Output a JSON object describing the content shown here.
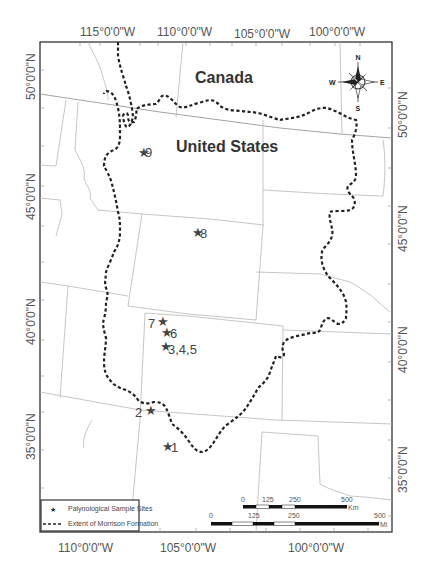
{
  "map": {
    "countries": [
      {
        "name": "Canada"
      },
      {
        "name": "United States"
      }
    ],
    "longitude_labels_top": [
      "115°0'0\"W",
      "110°0'0\"W",
      "105°0'0\"W",
      "100°0'0\"W"
    ],
    "longitude_labels_bottom": [
      "110°0'0\"W",
      "105°0'0\"W",
      "100°0'0\"W"
    ],
    "latitude_labels_left": [
      "50°0'0\"N",
      "45°0'0\"N",
      "40°0'0\"N",
      "35°0'0\"N"
    ],
    "latitude_labels_right": [
      "50°0'0\"N",
      "45°0'0\"N",
      "40°0'0\"N",
      "35°0'0\"N"
    ],
    "sites": [
      {
        "label": "9"
      },
      {
        "label": "8"
      },
      {
        "label": "7"
      },
      {
        "label": "6"
      },
      {
        "label": "3,4,5"
      },
      {
        "label": "2"
      },
      {
        "label": "1"
      }
    ],
    "compass": {
      "n": "N",
      "s": "S",
      "e": "E",
      "w": "W"
    },
    "legend": {
      "items": [
        {
          "symbol": "star",
          "label": "Palynological Sample Sites"
        },
        {
          "symbol": "dashed-line",
          "label": "Extent of Morrison Formation"
        }
      ]
    },
    "scale_bars": [
      {
        "unit": "Km",
        "ticks": [
          "0",
          "125",
          "250",
          "500"
        ]
      },
      {
        "unit": "Mi",
        "ticks": [
          "0",
          "125",
          "250",
          "500"
        ]
      }
    ],
    "colors": {
      "frame": "#333333",
      "morrison_line": "#222222",
      "state_lines": "#b8b8b8"
    }
  }
}
